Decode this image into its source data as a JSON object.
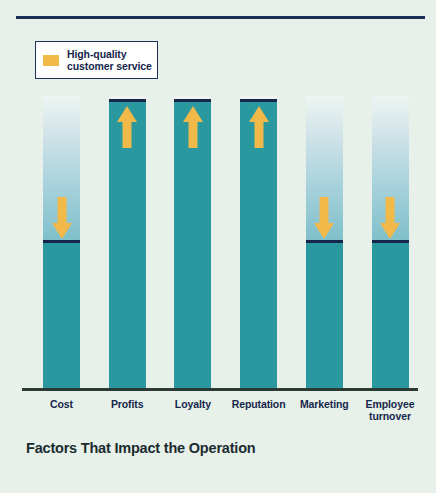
{
  "figure": {
    "caption": "Factors That Impact the Operation",
    "background_color": "#e7f1ea",
    "rule_color": "#1b2f57"
  },
  "legend": {
    "swatch_color": "#f0b94a",
    "line1": "High-quality",
    "line2": "customer service",
    "border_color": "#1b2f57",
    "background_color": "#ffffff"
  },
  "chart_data": {
    "type": "bar",
    "title": "Factors That Impact the Operation",
    "xlabel": "",
    "ylabel": "",
    "grid": false,
    "legend_position": "top-left",
    "legend_entries": [
      "High-quality customer service"
    ],
    "axis_note": "Unlabeled vertical axis; bar heights shown as relative percent of plot height.",
    "bar_color": "#2a989f",
    "cap_color": "#16264a",
    "arrow_color": "#f0b94a",
    "categories": [
      "Cost",
      "Profits",
      "Loyalty",
      "Reputation",
      "Marketing",
      "Employee turnover"
    ],
    "values": [
      50,
      98,
      98,
      98,
      50,
      50
    ],
    "annotations": [
      {
        "category": "Cost",
        "arrow": "down",
        "meaning": "decrease"
      },
      {
        "category": "Profits",
        "arrow": "up",
        "meaning": "increase"
      },
      {
        "category": "Loyalty",
        "arrow": "up",
        "meaning": "increase"
      },
      {
        "category": "Reputation",
        "arrow": "up",
        "meaning": "increase"
      },
      {
        "category": "Marketing",
        "arrow": "down",
        "meaning": "decrease"
      },
      {
        "category": "Employee turnover",
        "arrow": "down",
        "meaning": "decrease"
      }
    ]
  }
}
